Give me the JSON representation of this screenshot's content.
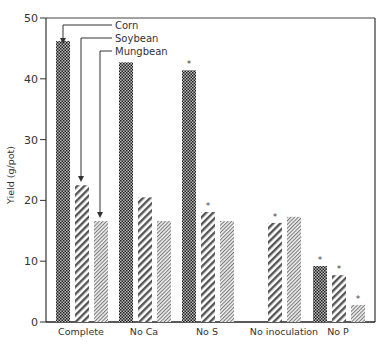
{
  "chart_data": {
    "type": "bar",
    "title": "",
    "xlabel": "",
    "ylabel": "Yield (g/pot)",
    "ylim": [
      0,
      50
    ],
    "yticks": [
      0,
      10,
      20,
      30,
      40,
      50
    ],
    "grid": false,
    "legend_position": "top-left (callout arrows)",
    "categories": [
      "Complete",
      "No Ca",
      "No S",
      "No inoculation",
      "No P"
    ],
    "series": [
      {
        "name": "Corn",
        "pattern": "dense-checker",
        "values": [
          46.2,
          42.7,
          41.4,
          null,
          9.2
        ],
        "significant": [
          false,
          false,
          true,
          false,
          true
        ]
      },
      {
        "name": "Soybean",
        "pattern": "wide-diagonal-hatch",
        "values": [
          22.5,
          20.5,
          18.1,
          16.3,
          7.7
        ],
        "significant": [
          false,
          false,
          true,
          true,
          true
        ]
      },
      {
        "name": "Mungbean",
        "pattern": "fine-diagonal-hatch",
        "values": [
          16.6,
          16.6,
          16.6,
          17.3,
          2.8
        ],
        "significant": [
          false,
          false,
          false,
          false,
          true
        ]
      }
    ],
    "annotations": [
      "* marks significant difference from Complete"
    ]
  },
  "labels": {
    "ylabel": "Yield (g/pot)",
    "yticks": [
      "0",
      "10",
      "20",
      "30",
      "40",
      "50"
    ],
    "categories": [
      "Complete",
      "No Ca",
      "No S",
      "No inoculation",
      "No P"
    ],
    "legend": [
      "Corn",
      "Soybean",
      "Mungbean"
    ],
    "star": "*"
  }
}
